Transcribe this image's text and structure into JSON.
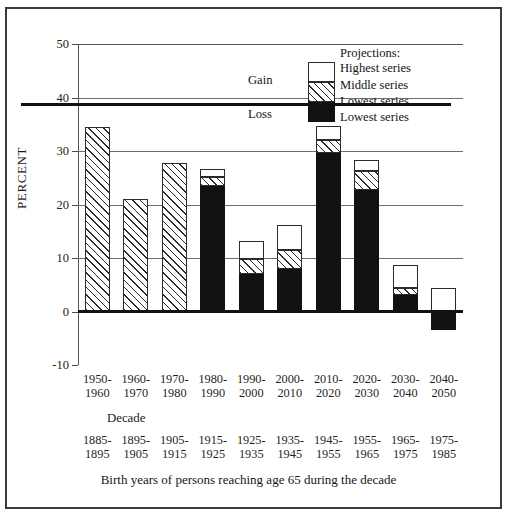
{
  "axes": {
    "ylabel": "PERCENT",
    "xlabel": "Decade",
    "ytick_labels": [
      "50",
      "40",
      "30",
      "20",
      "10",
      "0",
      "-10"
    ],
    "ylim": [
      -10,
      50
    ],
    "ytick_values": [
      50,
      40,
      30,
      20,
      10,
      0,
      -10
    ]
  },
  "legend": {
    "title": "Projections:",
    "items": [
      "Highest series",
      "Middle series",
      "Lowest series",
      "Lowest series"
    ],
    "gain_label": "Gain",
    "loss_label": "Loss"
  },
  "bottom_caption": "Birth years of persons reaching age 65 during the decade",
  "source_note": "SOURCE: Table 14 and 15.",
  "chart_data": {
    "type": "bar",
    "title": "",
    "subtitle": "",
    "xlabel": "Decade",
    "ylabel": "PERCENT",
    "ylim": [
      -10,
      50
    ],
    "grid": true,
    "legend_position": "inside-top-right",
    "stacked": true,
    "categories": [
      "1950-\n1960",
      "1960-\n1970",
      "1970-\n1980",
      "1980-\n1990",
      "1990-\n2000",
      "2000-\n2010",
      "2010-\n2020",
      "2020-\n2030",
      "2030-\n2040",
      "2040-\n2050"
    ],
    "secondary_categories": [
      "1885-\n1895",
      "1895-\n1905",
      "1905-\n1915",
      "1915-\n1925",
      "1925-\n1935",
      "1935-\n1945",
      "1945-\n1955",
      "1955-\n1965",
      "1965-\n1975",
      "1975-\n1985"
    ],
    "secondary_axis_label": "Birth years of persons reaching age 65 during the decade",
    "series": [
      {
        "name": "Lowest series",
        "style": "black",
        "values": [
          null,
          null,
          null,
          23.4,
          7.0,
          8.0,
          29.6,
          22.8,
          3.1,
          -3.4
        ]
      },
      {
        "name": "Middle series",
        "style": "hatched",
        "values": [
          34.5,
          21.0,
          27.7,
          25.2,
          9.8,
          11.5,
          32.0,
          26.2,
          4.3,
          -3.4
        ]
      },
      {
        "name": "Highest series",
        "style": "white",
        "values": [
          34.5,
          21.0,
          27.7,
          26.6,
          13.2,
          16.2,
          34.6,
          28.3,
          8.7,
          4.4
        ]
      }
    ],
    "historical_bars": [
      0,
      1,
      2
    ],
    "historical_note": "First three bars are single hatched bars (observed values)."
  },
  "bars_render": [
    {
      "decade": "1950-1960",
      "black": null,
      "hatch_top": 34.5,
      "white_top": null,
      "negative": null
    },
    {
      "decade": "1960-1970",
      "black": null,
      "hatch_top": 21.0,
      "white_top": null,
      "negative": null
    },
    {
      "decade": "1970-1980",
      "black": null,
      "hatch_top": 27.7,
      "white_top": null,
      "negative": null
    },
    {
      "decade": "1980-1990",
      "black": 23.4,
      "hatch_top": 25.2,
      "white_top": 26.6,
      "negative": null
    },
    {
      "decade": "1990-2000",
      "black": 7.0,
      "hatch_top": 9.8,
      "white_top": 13.2,
      "negative": null
    },
    {
      "decade": "2000-2010",
      "black": 8.0,
      "hatch_top": 11.5,
      "white_top": 16.2,
      "negative": null
    },
    {
      "decade": "2010-2020",
      "black": 29.6,
      "hatch_top": 32.0,
      "white_top": 34.6,
      "negative": null
    },
    {
      "decade": "2020-2030",
      "black": 22.8,
      "hatch_top": 26.2,
      "white_top": 28.3,
      "negative": null
    },
    {
      "decade": "2030-2040",
      "black": 3.1,
      "hatch_top": 4.3,
      "white_top": 8.7,
      "negative": null
    },
    {
      "decade": "2040-2050",
      "black": 0,
      "hatch_top": 0,
      "white_top": 4.4,
      "negative": -3.4
    }
  ]
}
